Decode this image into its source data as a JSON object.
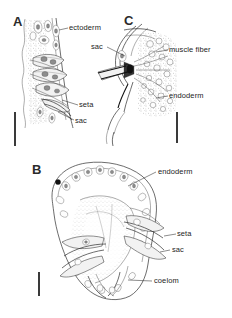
{
  "figure": {
    "background_color": "#ffffff",
    "ink_color": "#2e2e2e",
    "width": 232,
    "height": 318
  },
  "panels": [
    {
      "id": "A",
      "letter": "A",
      "description": "Longitudinal section through body wall showing ectoderm, setae and setal sac",
      "labels": [
        {
          "key": "ectoderm",
          "text": "ectoderm"
        },
        {
          "key": "seta",
          "text": "seta"
        },
        {
          "key": "sac",
          "text": "sac"
        }
      ],
      "scale_bar": {
        "orientation": "vertical",
        "length_px": 34
      }
    },
    {
      "id": "C",
      "letter": "C",
      "description": "Detail of seta base with surrounding muscle fibres and endoderm",
      "labels": [
        {
          "key": "sac",
          "text": "sac"
        },
        {
          "key": "muscle_fiber",
          "text": "muscle fiber"
        },
        {
          "key": "endoderm",
          "text": "endoderm"
        }
      ],
      "scale_bar": {
        "orientation": "vertical",
        "length_px": 31
      }
    },
    {
      "id": "B",
      "letter": "B",
      "description": "Transverse section of segment showing coelom, endoderm, setae and sacs",
      "labels": [
        {
          "key": "endoderm",
          "text": "endoderm"
        },
        {
          "key": "seta",
          "text": "seta"
        },
        {
          "key": "sac",
          "text": "sac"
        },
        {
          "key": "coelom",
          "text": "coelom"
        }
      ],
      "scale_bar": {
        "orientation": "vertical",
        "length_px": 24
      }
    }
  ],
  "label_text": {
    "a_ectoderm": "ectoderm",
    "a_seta": "seta",
    "a_sac": "sac",
    "c_sac": "sac",
    "c_muscle_fiber": "muscle fiber",
    "c_endoderm": "endoderm",
    "b_endoderm": "endoderm",
    "b_seta": "seta",
    "b_sac": "sac",
    "b_coelom": "coelom"
  },
  "panel_letters": {
    "a": "A",
    "b": "B",
    "c": "C"
  }
}
